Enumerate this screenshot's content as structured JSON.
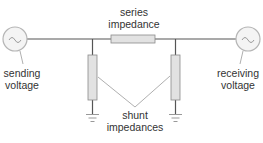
{
  "diagram": {
    "type": "transmission-line-equivalent-circuit",
    "colors": {
      "wire": "#555555",
      "source_stroke": "#b5b5b5",
      "source_fill": "#f4f4f4",
      "impedance_fill": "#e2e2e2",
      "impedance_stroke": "#8a8a8a",
      "leader": "#9a9a9a",
      "ground": "#999999",
      "text": "#333333"
    },
    "labels": {
      "series_impedance": [
        "series",
        "impedance"
      ],
      "sending_voltage": [
        "sending",
        "voltage"
      ],
      "receiving_voltage": [
        "receiving",
        "voltage"
      ],
      "shunt_impedances": [
        "shunt",
        "impedances"
      ]
    },
    "sources": [
      {
        "name": "sending",
        "symbol": "~",
        "cx": 15,
        "cy": 39,
        "r": 12
      },
      {
        "name": "receiving",
        "symbol": "~",
        "cx": 248,
        "cy": 39,
        "r": 12
      }
    ],
    "components": {
      "series_impedance": {
        "x": 111,
        "y": 35,
        "w": 44,
        "h": 8
      },
      "shunt_left": {
        "x": 88,
        "y": 55,
        "w": 9,
        "h": 45,
        "tap_x": 92
      },
      "shunt_right": {
        "x": 171,
        "y": 55,
        "w": 9,
        "h": 45,
        "tap_x": 176
      }
    }
  }
}
